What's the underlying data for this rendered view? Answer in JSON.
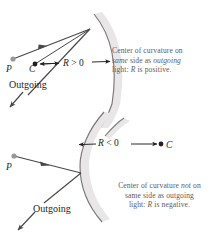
{
  "figure": {
    "background_color": "#ffffff",
    "ink_color": "#231f20",
    "ray_color": "#4a4748",
    "caption_color": "#5f5b5c",
    "mirror_band_color": "#e8e6e6",
    "mirror_outline_color": "#7a7778",
    "point_p_color": "#9b9798",
    "point_c_color": "#231f20"
  },
  "panels": [
    {
      "id": "positive-radius",
      "point_p_label": "P",
      "point_c_label": "C",
      "outgoing_label": "Outgoing",
      "radius_label_variable": "R",
      "radius_label_relation": " > 0",
      "radius_label_full": "R > 0",
      "caption": {
        "line1_a": "Center of curvature on",
        "line2_em1": "same",
        "line2_b": " side as ",
        "line2_em2": "outgoing",
        "line3_a": "light: ",
        "line3_em": "R",
        "line3_b": " is positive."
      }
    },
    {
      "id": "negative-radius",
      "point_p_label": "P",
      "point_c_label": "C",
      "outgoing_label": "Outgoing",
      "radius_label_variable": "R",
      "radius_label_relation": " < 0",
      "radius_label_full": "R < 0",
      "caption": {
        "line1_a": "Center of curvature ",
        "line1_em": "not",
        "line1_b": " on",
        "line2": "same side as outgoing",
        "line3_a": "light: ",
        "line3_em": "R",
        "line3_b": " is negative."
      }
    }
  ]
}
